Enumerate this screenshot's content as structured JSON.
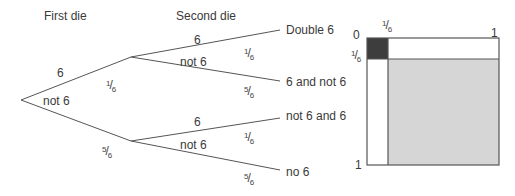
{
  "headers": {
    "first_die": "First die",
    "second_die": "Second die"
  },
  "tree": {
    "first_level": {
      "upper_label": "6",
      "lower_label": "not 6",
      "upper_prob": {
        "num": "1",
        "den": "6"
      },
      "lower_prob": {
        "num": "5",
        "den": "6"
      }
    },
    "second_level_upper": {
      "upper_label": "6",
      "lower_label": "not 6",
      "upper_prob": {
        "num": "1",
        "den": "6"
      },
      "lower_prob": {
        "num": "5",
        "den": "6"
      }
    },
    "second_level_lower": {
      "upper_label": "6",
      "lower_label": "not 6",
      "upper_prob": {
        "num": "1",
        "den": "6"
      },
      "lower_prob": {
        "num": "5",
        "den": "6"
      }
    },
    "outcomes": [
      "Double 6",
      "6 and not 6",
      "not 6 and 6",
      "no 6"
    ]
  },
  "area_diagram": {
    "top_left_label": "0",
    "top_mid_label": {
      "num": "1",
      "den": "6"
    },
    "top_right_label": "1",
    "left_mid_label": {
      "num": "1",
      "den": "6"
    },
    "bottom_left_label": "1",
    "colors": {
      "double_six": "#3d3d3d",
      "no_six": "#d6d6d6",
      "border": "#555555",
      "white": "#ffffff"
    }
  }
}
